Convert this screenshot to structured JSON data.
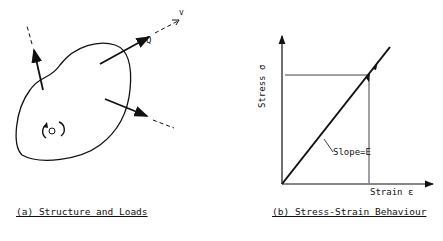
{
  "panel_a": {
    "caption": "(a) Structure and Loads",
    "load_label": "Q",
    "direction_label": "v",
    "point_label": "O"
  },
  "panel_b": {
    "caption": "(b) Stress-Strain Behaviour",
    "y_axis_label": "Stress σ",
    "x_axis_label": "Strain ε",
    "slope_label": "Slope=E"
  },
  "colors": {
    "ink": "#111111",
    "background": "#ffffff"
  }
}
